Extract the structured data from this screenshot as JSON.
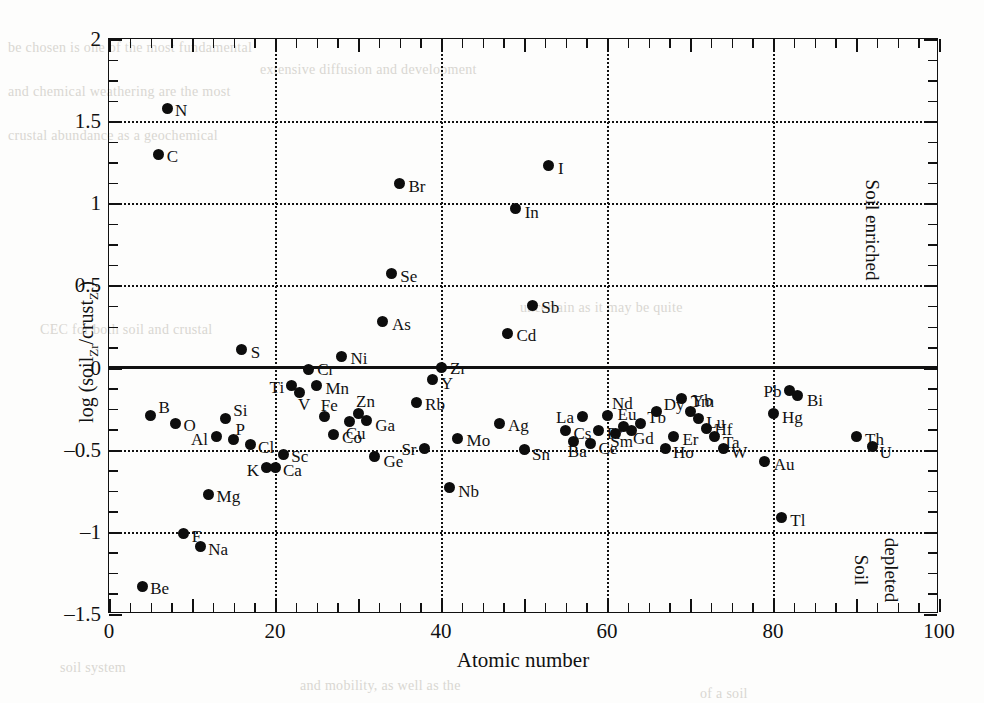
{
  "axes": {
    "x_title": "Atomic number",
    "y_title_pre": "log (soil",
    "y_title_sub1": "Zr",
    "y_title_mid": "/crust",
    "y_title_sub2": "Zr",
    "y_title_post": ")",
    "x_ticks": [
      "0",
      "20",
      "40",
      "60",
      "80",
      "100"
    ],
    "y_ticks": [
      "2",
      "1.5",
      "1",
      "0.5",
      "0",
      "-0.5",
      "-1",
      "-1.5"
    ]
  },
  "annotations": {
    "enriched": "Soil enriched",
    "depleted_line1": "Soil",
    "depleted_line2": "depleted"
  },
  "bleed_text": [
    "be chosen is one of the most fundamental",
    "extensive diffusion and development",
    "and chemical weathering are the most",
    "crustal abundance as a geochemical",
    "CEC for both soil and crustal",
    "uncertain as it may be quite",
    "soil system",
    "and mobility, as well as the",
    "of a soil"
  ],
  "chart_data": {
    "type": "scatter",
    "title": "",
    "xlabel": "Atomic number",
    "ylabel": "log (soilZr/crustZr)",
    "xlim": [
      0,
      100
    ],
    "ylim": [
      -1.5,
      2
    ],
    "grid": true,
    "gridlines_y": [
      1.5,
      1,
      0.5,
      -0.5,
      -1
    ],
    "gridlines_x": [
      20,
      40,
      60,
      80
    ],
    "reference_line_y": 0,
    "legend": "none",
    "points": [
      {
        "label": "Be",
        "x": 4,
        "y": -1.33,
        "lx": 8,
        "ly": -6
      },
      {
        "label": "B",
        "x": 5,
        "y": -0.29,
        "lx": 8,
        "ly": -16
      },
      {
        "label": "C",
        "x": 6,
        "y": 1.3,
        "lx": 8,
        "ly": -6
      },
      {
        "label": "N",
        "x": 7,
        "y": 1.58,
        "lx": 8,
        "ly": -6
      },
      {
        "label": "O",
        "x": 8,
        "y": -0.34,
        "lx": 8,
        "ly": -6
      },
      {
        "label": "F",
        "x": 9,
        "y": -1.01,
        "lx": 8,
        "ly": -6
      },
      {
        "label": "Na",
        "x": 11,
        "y": -1.09,
        "lx": 8,
        "ly": -6
      },
      {
        "label": "Mg",
        "x": 12,
        "y": -0.77,
        "lx": 8,
        "ly": -6
      },
      {
        "label": "Al",
        "x": 13,
        "y": -0.42,
        "lx": -26,
        "ly": -6
      },
      {
        "label": "Si",
        "x": 14,
        "y": -0.31,
        "lx": 8,
        "ly": -17
      },
      {
        "label": "P",
        "x": 15,
        "y": -0.44,
        "lx": 2,
        "ly": -19
      },
      {
        "label": "S",
        "x": 16,
        "y": 0.11,
        "lx": 9,
        "ly": -6
      },
      {
        "label": "Cl",
        "x": 17,
        "y": -0.47,
        "lx": 8,
        "ly": -6
      },
      {
        "label": "K",
        "x": 19,
        "y": -0.61,
        "lx": -20,
        "ly": -6
      },
      {
        "label": "Ca",
        "x": 20,
        "y": -0.61,
        "lx": 8,
        "ly": -6
      },
      {
        "label": "Sc",
        "x": 21,
        "y": -0.53,
        "lx": 8,
        "ly": -7
      },
      {
        "label": "Ti",
        "x": 22,
        "y": -0.11,
        "lx": -22,
        "ly": -7
      },
      {
        "label": "V",
        "x": 23,
        "y": -0.15,
        "lx": -2,
        "ly": 4
      },
      {
        "label": "Cr",
        "x": 24,
        "y": -0.01,
        "lx": 9,
        "ly": -8
      },
      {
        "label": "Mn",
        "x": 25,
        "y": -0.11,
        "lx": 9,
        "ly": -6
      },
      {
        "label": "Fe",
        "x": 26,
        "y": -0.3,
        "lx": -4,
        "ly": -20
      },
      {
        "label": "Co",
        "x": 27,
        "y": -0.41,
        "lx": 9,
        "ly": -6
      },
      {
        "label": "Cu",
        "x": 29,
        "y": -0.33,
        "lx": -4,
        "ly": 3
      },
      {
        "label": "Ni",
        "x": 28,
        "y": 0.07,
        "lx": 9,
        "ly": -6
      },
      {
        "label": "Zn",
        "x": 30,
        "y": -0.28,
        "lx": -2,
        "ly": -21
      },
      {
        "label": "Ga",
        "x": 31,
        "y": -0.32,
        "lx": 9,
        "ly": -3
      },
      {
        "label": "Ge",
        "x": 32,
        "y": -0.54,
        "lx": 9,
        "ly": -3
      },
      {
        "label": "As",
        "x": 33,
        "y": 0.28,
        "lx": 9,
        "ly": -6
      },
      {
        "label": "Se",
        "x": 34,
        "y": 0.57,
        "lx": 9,
        "ly": -6
      },
      {
        "label": "Br",
        "x": 35,
        "y": 1.12,
        "lx": 9,
        "ly": -6
      },
      {
        "label": "Rb",
        "x": 37,
        "y": -0.21,
        "lx": 9,
        "ly": -6
      },
      {
        "label": "Sr",
        "x": 38,
        "y": -0.49,
        "lx": -23,
        "ly": -7
      },
      {
        "label": "Y",
        "x": 39,
        "y": -0.07,
        "lx": 8,
        "ly": -4
      },
      {
        "label": "Zr",
        "x": 40,
        "y": 0.0,
        "lx": 9,
        "ly": -8
      },
      {
        "label": "Nb",
        "x": 41,
        "y": -0.73,
        "lx": 9,
        "ly": -5
      },
      {
        "label": "Mo",
        "x": 42,
        "y": -0.43,
        "lx": 9,
        "ly": -6
      },
      {
        "label": "Ag",
        "x": 47,
        "y": -0.34,
        "lx": 9,
        "ly": -6
      },
      {
        "label": "Cd",
        "x": 48,
        "y": 0.21,
        "lx": 9,
        "ly": -6
      },
      {
        "label": "In",
        "x": 49,
        "y": 0.97,
        "lx": 9,
        "ly": -4
      },
      {
        "label": "Sn",
        "x": 50,
        "y": -0.5,
        "lx": 8,
        "ly": -4
      },
      {
        "label": "Sb",
        "x": 51,
        "y": 0.38,
        "lx": 9,
        "ly": -6
      },
      {
        "label": "I",
        "x": 53,
        "y": 1.23,
        "lx": 9,
        "ly": -6
      },
      {
        "label": "Cs",
        "x": 55,
        "y": -0.38,
        "lx": 8,
        "ly": -5
      },
      {
        "label": "Ba",
        "x": 56,
        "y": -0.45,
        "lx": -6,
        "ly": 1
      },
      {
        "label": "La",
        "x": 57,
        "y": -0.3,
        "lx": -26,
        "ly": -8
      },
      {
        "label": "Ce",
        "x": 58,
        "y": -0.46,
        "lx": 8,
        "ly": -3
      },
      {
        "label": "Pr",
        "x": 59,
        "y": -0.38,
        "lx": 8,
        "ly": -5
      },
      {
        "label": "Nd",
        "x": 60,
        "y": -0.29,
        "lx": 5,
        "ly": -20
      },
      {
        "label": "Sm",
        "x": 61,
        "y": -0.4,
        "lx": -5,
        "ly": 0
      },
      {
        "label": "Eu",
        "x": 62,
        "y": -0.36,
        "lx": -6,
        "ly": -21
      },
      {
        "label": "Gd",
        "x": 63,
        "y": -0.38,
        "lx": 1,
        "ly": 0
      },
      {
        "label": "Tb",
        "x": 64,
        "y": -0.34,
        "lx": 7,
        "ly": -14
      },
      {
        "label": "Dy",
        "x": 66,
        "y": -0.27,
        "lx": 7,
        "ly": -16
      },
      {
        "label": "Ho",
        "x": 67,
        "y": -0.49,
        "lx": 8,
        "ly": -4
      },
      {
        "label": "Er",
        "x": 68,
        "y": -0.42,
        "lx": 9,
        "ly": -6
      },
      {
        "label": "Tm",
        "x": 69,
        "y": -0.19,
        "lx": 9,
        "ly": -6
      },
      {
        "label": "Yb",
        "x": 70,
        "y": -0.27,
        "lx": 2,
        "ly": -20
      },
      {
        "label": "Lu",
        "x": 71,
        "y": -0.31,
        "lx": 8,
        "ly": -5
      },
      {
        "label": "Hf",
        "x": 72,
        "y": -0.37,
        "lx": 8,
        "ly": -7
      },
      {
        "label": "Ta",
        "x": 73,
        "y": -0.42,
        "lx": 8,
        "ly": -3
      },
      {
        "label": "W",
        "x": 74,
        "y": -0.49,
        "lx": 8,
        "ly": -4
      },
      {
        "label": "Au",
        "x": 79,
        "y": -0.57,
        "lx": 9,
        "ly": -5
      },
      {
        "label": "Hg",
        "x": 80,
        "y": -0.28,
        "lx": 9,
        "ly": -5
      },
      {
        "label": "Tl",
        "x": 81,
        "y": -0.91,
        "lx": 9,
        "ly": -5
      },
      {
        "label": "Pb",
        "x": 82,
        "y": -0.14,
        "lx": -26,
        "ly": -8
      },
      {
        "label": "Bi",
        "x": 83,
        "y": -0.17,
        "lx": 9,
        "ly": -4
      },
      {
        "label": "Th",
        "x": 90,
        "y": -0.42,
        "lx": 9,
        "ly": -6
      },
      {
        "label": "U",
        "x": 92,
        "y": -0.48,
        "lx": 7,
        "ly": -2
      }
    ]
  }
}
